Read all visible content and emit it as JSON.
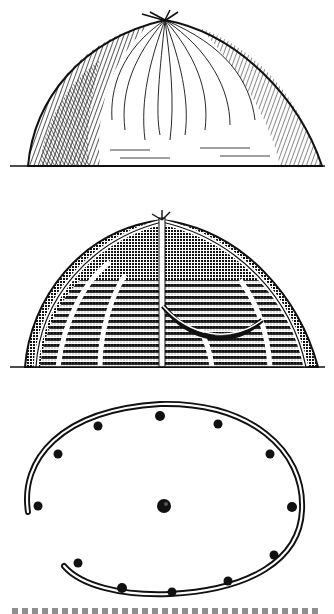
{
  "figure": {
    "style": "black-and-white engraving",
    "colors": {
      "ink": "#111111",
      "paper": "#ffffff"
    },
    "panels": [
      {
        "name": "hut-exterior",
        "description": "Thatched dome hut, exterior view"
      },
      {
        "name": "hut-framework",
        "description": "Cut-away dome showing arched pole framework, central post and hammock"
      },
      {
        "name": "hut-ground-plan",
        "description": "Ground plan: open oval ring of poles with post holes and central post"
      }
    ],
    "caption": {
      "text": "",
      "note": "caption clipped at bottom edge, illegible"
    }
  }
}
